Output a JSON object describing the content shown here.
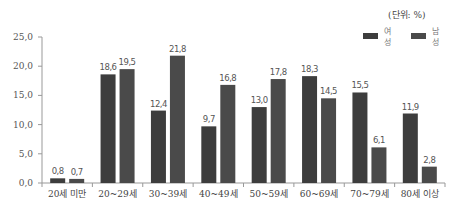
{
  "chart_data": {
    "type": "bar",
    "title": "",
    "unit_note": "(단위: %)",
    "xlabel": "",
    "ylabel": "",
    "ylim": [
      0,
      25
    ],
    "yticks": [
      "0.0",
      "5.0",
      "10.0",
      "15.0",
      "20.0",
      "25.0"
    ],
    "grid": false,
    "legend_position": "top-right",
    "categories": [
      "20세 미만",
      "20~29세",
      "30~39세",
      "40~49세",
      "50~59세",
      "60~69세",
      "70~79세",
      "80세 이상"
    ],
    "series": [
      {
        "name": "여성",
        "color": "#3d3d3d",
        "values": [
          0.8,
          18.6,
          12.4,
          9.7,
          13.0,
          18.3,
          15.5,
          11.9
        ]
      },
      {
        "name": "남성",
        "color": "#4a4a4a",
        "values": [
          0.7,
          19.5,
          21.8,
          16.8,
          17.8,
          14.5,
          6.1,
          2.8
        ]
      }
    ]
  }
}
